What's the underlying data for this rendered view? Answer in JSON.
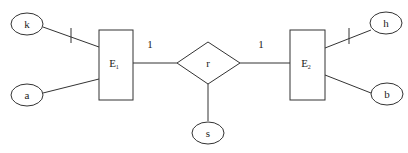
{
  "diagram": {
    "type": "ER diagram",
    "entities": [
      {
        "id": "E1",
        "label": "E",
        "subscript": "1"
      },
      {
        "id": "E2",
        "label": "E",
        "subscript": "2"
      }
    ],
    "relationship": {
      "id": "r",
      "label": "r"
    },
    "attributes": [
      {
        "id": "k",
        "label": "k",
        "entity": "E1",
        "key": true
      },
      {
        "id": "a",
        "label": "a",
        "entity": "E1",
        "key": false
      },
      {
        "id": "h",
        "label": "h",
        "entity": "E2",
        "key": true
      },
      {
        "id": "b",
        "label": "b",
        "entity": "E2",
        "key": false
      },
      {
        "id": "s",
        "label": "s",
        "entity": "r",
        "key": false
      }
    ],
    "cardinalities": {
      "E1_r": "1",
      "r_E2": "1"
    }
  }
}
